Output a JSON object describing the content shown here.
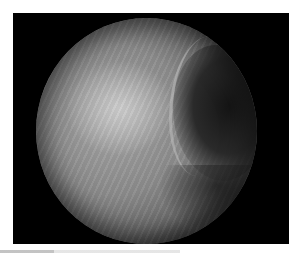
{
  "image": {
    "description": "Grayscale endoscopic view shown in a circular field on a black rectangular background",
    "frame_color": "#000000",
    "background_color": "#ffffff",
    "field_shape": "circle"
  },
  "caption": {
    "text": ""
  }
}
